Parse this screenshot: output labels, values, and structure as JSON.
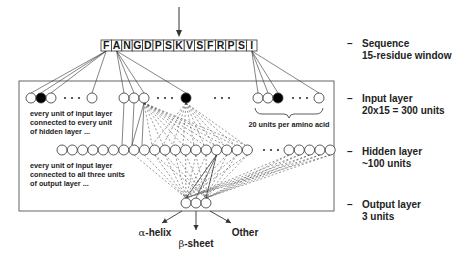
{
  "diagram": {
    "sequence": {
      "residues": [
        "F",
        "A",
        "N",
        "G",
        "D",
        "P",
        "S",
        "K",
        "V",
        "S",
        "F",
        "R",
        "P",
        "S",
        "I"
      ],
      "center_marker": "arrow-down-icon"
    },
    "layer_labels": [
      {
        "dash": "–",
        "line1": "Sequence",
        "line2": "15-residue window"
      },
      {
        "dash": "–",
        "line1": "Input layer",
        "line2": "20x15 = 300 units"
      },
      {
        "dash": "–",
        "line1": "Hidden layer",
        "line2": "~100 units"
      },
      {
        "dash": "–",
        "line1": "Output layer",
        "line2": "3 units"
      }
    ],
    "notes": {
      "input_hidden": [
        "every unit of input layer",
        "connected to every unit",
        "of hidden layer ..."
      ],
      "hidden_output": [
        "every unit of input layer",
        "connected to all three units",
        "of output layer ..."
      ],
      "amino_acid_brace": "20 units per amino acid"
    },
    "input_layer": {
      "groups": [
        {
          "residue": "F",
          "active_index": 1,
          "visible_units": 4
        },
        {
          "residue": "A",
          "active_index": 3,
          "visible_units": 4
        },
        {
          "residue": "I",
          "active_index": 2,
          "visible_units": 4
        }
      ],
      "ellipsis": "• • •"
    },
    "hidden_layer": {
      "visible_units_left": 19,
      "visible_units_right": 5,
      "ellipsis": "• • •"
    },
    "output_layer": {
      "units": 3,
      "outputs": [
        {
          "greek": "α",
          "text": "-helix"
        },
        {
          "greek": "β",
          "text": "-sheet"
        },
        {
          "greek": "",
          "text": "Other"
        }
      ]
    },
    "colors": {
      "stroke": "#333333",
      "active_unit": "#000000",
      "inactive_unit": "#ffffff",
      "box": "#555555"
    }
  }
}
